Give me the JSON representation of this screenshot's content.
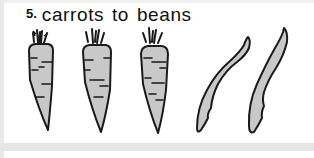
{
  "item": {
    "number": "5.",
    "label": "carrots to beans"
  },
  "illustration": {
    "carrots_count": 3,
    "beans_count": 2,
    "fill_color": "#c8c8c8",
    "stroke_color": "#1a1a1a"
  }
}
